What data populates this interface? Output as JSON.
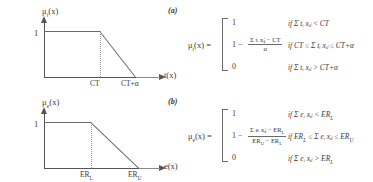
{
  "figure": {
    "panels": [
      {
        "tag": "(a)",
        "chart": {
          "ylabel": "μ",
          "ylabel_sub": "t",
          "ylabel_tail": "(x)",
          "xlabel": "t(x)",
          "ymax_label": "1",
          "ticks": [
            {
              "label": "CT",
              "sub": ""
            },
            {
              "label": "CT+α",
              "sub": ""
            }
          ]
        },
        "formula": {
          "lhs": "μ",
          "lhs_sub": "t",
          "lhs_tail": "(x) =",
          "cases": [
            {
              "value": "1",
              "type": "plain"
            },
            {
              "value": "1 −",
              "type": "fraction",
              "numerator": "Σ tᵢ xᵢⱼ − CT",
              "denominator": "α"
            },
            {
              "value": "0",
              "type": "plain"
            }
          ],
          "conditions": [
            "if  Σ tᵢ xᵢⱼ < CT",
            "if  CT ≤ Σ tᵢ xᵢⱼ ≤ CT+α",
            "if  Σ tᵢ xᵢⱼ > CT+α"
          ]
        }
      },
      {
        "tag": "(b)",
        "chart": {
          "ylabel": "μ",
          "ylabel_sub": "e",
          "ylabel_tail": "(x)",
          "xlabel": "e(x)",
          "ymax_label": "1",
          "ticks": [
            {
              "label": "ER",
              "sub": "L"
            },
            {
              "label": "ER",
              "sub": "U"
            }
          ]
        },
        "formula": {
          "lhs": "μ",
          "lhs_sub": "e",
          "lhs_tail": "(x) =",
          "cases": [
            {
              "value": "1",
              "type": "plain"
            },
            {
              "value": "1 −",
              "type": "fraction",
              "numerator": "Σ eᵢ xᵢⱼ − ER",
              "numerator_sub": "L",
              "denominator": "ER",
              "denominator_sub_a": "U",
              "denominator_mid": " − ER",
              "denominator_sub_b": "L"
            },
            {
              "value": "0",
              "type": "plain"
            }
          ],
          "conditions": [
            "if  Σ eᵢ xᵢⱼ < ER",
            "if  ER",
            "if  Σ eᵢ xᵢⱼ > ER"
          ],
          "condition_subs": [
            "L",
            "",
            "L"
          ],
          "condition_mid": " ≤ Σ eᵢ xᵢⱼ ≤ ER",
          "condition_mid_sub_a": "L",
          "condition_mid_sub_b": "U"
        }
      }
    ]
  }
}
